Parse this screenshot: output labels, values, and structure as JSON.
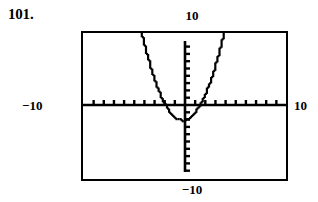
{
  "exercise": {
    "number": "101."
  },
  "graph_window": {
    "label_top": "10",
    "label_bottom": "−10",
    "label_left": "−10",
    "label_right": "10"
  },
  "chart_data": {
    "type": "line",
    "title": "",
    "subtitle": "",
    "xlabel": "",
    "ylabel": "",
    "xlim": [
      -10,
      10
    ],
    "ylim": [
      -10,
      10
    ],
    "grid": false,
    "legend": null,
    "axis_ticks": {
      "x_tick_interval": 1,
      "y_tick_interval": 1,
      "x_tick_count": 20,
      "y_tick_count": 20
    },
    "tick_labels": {
      "x": [
        "-10",
        "10"
      ],
      "y": [
        "-10",
        "10"
      ]
    },
    "annotations": [],
    "series": [
      {
        "name": "parabola",
        "style": "pixelated",
        "vertex": [
          -0.3,
          -2.1
        ],
        "x_intercepts": [
          -1.7,
          1.4
        ],
        "x": [
          -3.4,
          -3.2,
          -3.0,
          -2.8,
          -2.6,
          -2.4,
          -2.2,
          -2.0,
          -1.8,
          -1.6,
          -1.4,
          -1.2,
          -1.0,
          -0.8,
          -0.6,
          -0.4,
          -0.2,
          0.0,
          0.2,
          0.4,
          0.6,
          0.8,
          1.0,
          1.2,
          1.4,
          1.6,
          1.8,
          2.0,
          2.2,
          2.4,
          2.6,
          2.8,
          3.0,
          3.2,
          3.4
        ],
        "y": [
          9.5,
          8.0,
          6.7,
          5.4,
          4.3,
          3.2,
          2.3,
          1.5,
          0.7,
          0.1,
          -0.4,
          -0.9,
          -1.3,
          -1.6,
          -1.9,
          -2.0,
          -2.1,
          -2.1,
          -2.0,
          -1.8,
          -1.6,
          -1.3,
          -0.9,
          -0.4,
          0.1,
          0.7,
          1.5,
          2.3,
          3.2,
          4.3,
          5.4,
          6.7,
          8.0,
          9.5,
          11.0
        ]
      }
    ]
  }
}
